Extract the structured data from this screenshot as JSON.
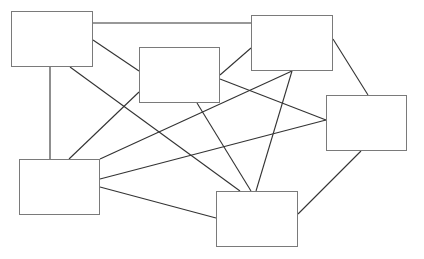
{
  "diagram": {
    "type": "network-graph",
    "colors": {
      "edge": "#333333",
      "node_border": "#7a7a7a",
      "background": "#ffffff"
    },
    "nodes": [
      {
        "id": "A",
        "label": "",
        "x": 11,
        "y": 11,
        "w": 82,
        "h": 56
      },
      {
        "id": "B",
        "label": "",
        "x": 139,
        "y": 47,
        "w": 81,
        "h": 56
      },
      {
        "id": "C",
        "label": "",
        "x": 251,
        "y": 15,
        "w": 82,
        "h": 56
      },
      {
        "id": "D",
        "label": "",
        "x": 326,
        "y": 95,
        "w": 81,
        "h": 56
      },
      {
        "id": "E",
        "label": "",
        "x": 19,
        "y": 159,
        "w": 81,
        "h": 56
      },
      {
        "id": "F",
        "label": "",
        "x": 216,
        "y": 191,
        "w": 82,
        "h": 56
      }
    ],
    "edges": [
      {
        "from": "A",
        "to": "C",
        "x1": 93,
        "y1": 23,
        "x2": 251,
        "y2": 23
      },
      {
        "from": "A",
        "to": "B",
        "x1": 93,
        "y1": 40,
        "x2": 139,
        "y2": 71
      },
      {
        "from": "A",
        "to": "E",
        "x1": 50,
        "y1": 67,
        "x2": 50,
        "y2": 159
      },
      {
        "from": "A",
        "to": "F",
        "x1": 70,
        "y1": 67,
        "x2": 240,
        "y2": 191
      },
      {
        "from": "B",
        "to": "C",
        "x1": 220,
        "y1": 75,
        "x2": 251,
        "y2": 48
      },
      {
        "from": "B",
        "to": "E",
        "x1": 139,
        "y1": 92,
        "x2": 69,
        "y2": 159
      },
      {
        "from": "B",
        "to": "D",
        "x1": 220,
        "y1": 79,
        "x2": 326,
        "y2": 120
      },
      {
        "from": "B",
        "to": "F",
        "x1": 197,
        "y1": 103,
        "x2": 251,
        "y2": 191
      },
      {
        "from": "C",
        "to": "E",
        "x1": 292,
        "y1": 71,
        "x2": 100,
        "y2": 159
      },
      {
        "from": "C",
        "to": "F",
        "x1": 292,
        "y1": 71,
        "x2": 256,
        "y2": 191
      },
      {
        "from": "C",
        "to": "D",
        "x1": 333,
        "y1": 39,
        "x2": 368,
        "y2": 95
      },
      {
        "from": "E",
        "to": "D",
        "x1": 100,
        "y1": 179,
        "x2": 326,
        "y2": 120
      },
      {
        "from": "E",
        "to": "F",
        "x1": 100,
        "y1": 187,
        "x2": 216,
        "y2": 218
      },
      {
        "from": "D",
        "to": "F",
        "x1": 361,
        "y1": 151,
        "x2": 298,
        "y2": 214
      }
    ]
  },
  "caption": {
    "text": ""
  }
}
